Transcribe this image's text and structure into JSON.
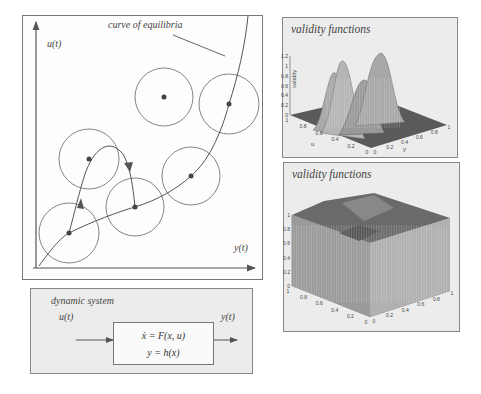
{
  "main_diagram": {
    "y_axis_label": "u(t)",
    "x_axis_label": "y(t)",
    "curve_label": "curve of equilibria",
    "circles": 6,
    "equilibria_points_on_curve": 4,
    "off_curve_points": 2
  },
  "dynamic_system": {
    "title": "dynamic system",
    "input_label": "u(t)",
    "output_label": "y(t)",
    "equation_1": "ẋ = F(x, u)",
    "equation_2": "y = h(x)"
  },
  "plot_top": {
    "title": "validity functions",
    "z_axis_label": "validity",
    "z_ticks": [
      "0",
      "0.2",
      "0.4",
      "0.6",
      "0.8",
      "1",
      "1.2"
    ],
    "u_axis_label": "u",
    "u_ticks": [
      "1",
      "0.8",
      "0.6",
      "0.4",
      "0.2",
      "0"
    ],
    "y_axis_label": "y",
    "y_ticks": [
      "0",
      "0.2",
      "0.4",
      "0.6",
      "0.8",
      "1"
    ]
  },
  "plot_bottom": {
    "title": "validity functions",
    "z_ticks": [
      "0",
      "0.2",
      "0.4",
      "0.6",
      "0.8",
      "1"
    ],
    "u_ticks": [
      "1",
      "0.8",
      "0.6",
      "0.4",
      "0.2",
      "0"
    ],
    "y_ticks": [
      "0",
      "0.2",
      "0.4",
      "0.6",
      "0.8",
      "1"
    ]
  },
  "colors": {
    "line": "#555555",
    "panel_bg": "#ececec",
    "surface_dark": "#555555",
    "surface_light": "#bbbbbb"
  }
}
